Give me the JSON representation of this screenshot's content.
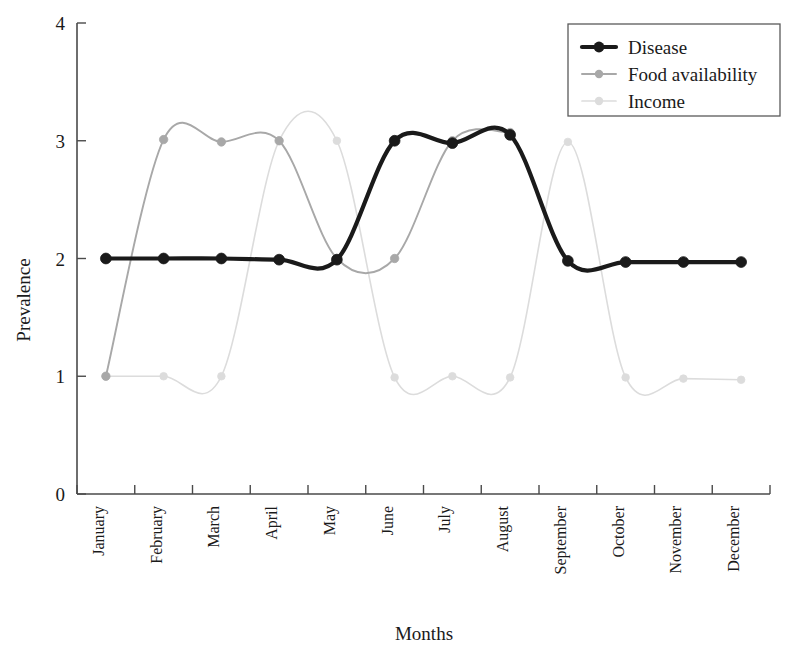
{
  "chart_data": {
    "type": "line",
    "title": "",
    "xlabel": "Months",
    "ylabel": "Prevalence",
    "categories": [
      "January",
      "February",
      "March",
      "April",
      "May",
      "June",
      "July",
      "August",
      "September",
      "October",
      "November",
      "December"
    ],
    "x_tick_labels": [
      "January",
      "February",
      "March",
      "April",
      "May",
      "June",
      "July",
      "August",
      "September",
      "October",
      "November",
      "December"
    ],
    "y_tick_labels": [
      "0",
      "1",
      "2",
      "3",
      "4"
    ],
    "y_ticks": [
      0,
      1,
      2,
      3,
      4
    ],
    "ylim": [
      0,
      4
    ],
    "grid": false,
    "legend_position": "top-right",
    "series": [
      {
        "name": "Disease",
        "color": "#1a1a1a",
        "values": [
          2.0,
          2.0,
          2.0,
          1.99,
          1.99,
          3.0,
          2.98,
          3.05,
          1.98,
          1.97,
          1.97,
          1.97
        ],
        "marker": "circle"
      },
      {
        "name": "Food availability",
        "color": "#a8a8a8",
        "values": [
          1.0,
          3.01,
          2.99,
          3.0,
          2.0,
          2.0,
          3.0,
          3.07,
          null,
          null,
          null,
          null
        ],
        "marker": "circle"
      },
      {
        "name": "Income",
        "color": "#dcdcdc",
        "values": [
          1.0,
          1.0,
          1.0,
          3.0,
          3.0,
          0.99,
          1.0,
          0.99,
          2.99,
          0.99,
          0.98,
          0.97
        ],
        "marker": "circle"
      }
    ]
  },
  "axes": {
    "y_axis_label": "Prevalence",
    "x_axis_label": "Months"
  },
  "legend": {
    "entries": [
      {
        "label": "Disease"
      },
      {
        "label": "Food availability"
      },
      {
        "label": "Income"
      }
    ]
  },
  "colors": {
    "disease": "#1a1a1a",
    "food_availability": "#a8a8a8",
    "income": "#dcdcdc",
    "axis": "#4a4a4a",
    "background": "#ffffff"
  }
}
